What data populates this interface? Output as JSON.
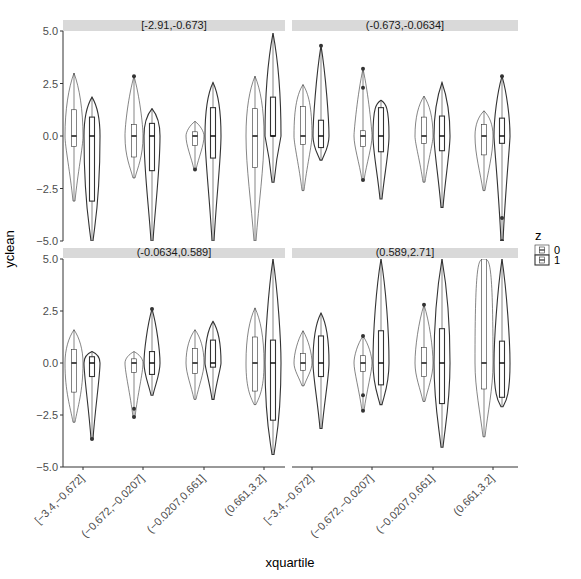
{
  "chart_data": {
    "type": "violin",
    "title": "",
    "xlabel": "xquartile",
    "ylabel": "yclean",
    "ylim": [
      -5.0,
      5.0
    ],
    "y_ticks": [
      "5.0",
      "2.5",
      "0.0",
      "-2.5",
      "-5.0"
    ],
    "grid": false,
    "facet_by": "xz quartile",
    "facet_layout": [
      2,
      2
    ],
    "legend": {
      "title": "z",
      "position": "right",
      "entries": [
        "0",
        "1"
      ]
    },
    "categories": [
      "[-3.4,-0.672]",
      "(-0.672,-0.0207]",
      "(-0.0207,0.661]",
      "(0.661,3.2]"
    ],
    "panels": [
      {
        "label": "[-2.91,-0.673]",
        "series": [
          {
            "name": "0",
            "groups": [
              {
                "min": -3.1,
                "q1": -0.5,
                "median": 0.0,
                "q3": 1.25,
                "max": 3.0,
                "outliers": []
              },
              {
                "min": -2.0,
                "q1": -1.0,
                "median": 0.0,
                "q3": 0.55,
                "max": 2.85,
                "outliers": [
                  2.85
                ]
              },
              {
                "min": -1.6,
                "q1": -0.45,
                "median": 0.0,
                "q3": 0.2,
                "max": 0.7,
                "outliers": [
                  -1.6
                ]
              },
              {
                "min": -5.0,
                "q1": -1.5,
                "median": 0.0,
                "q3": 1.3,
                "max": 2.85,
                "outliers": []
              }
            ]
          },
          {
            "name": "1",
            "groups": [
              {
                "min": -5.0,
                "q1": -3.1,
                "median": 0.0,
                "q3": 0.9,
                "max": 1.85,
                "outliers": []
              },
              {
                "min": -5.0,
                "q1": -1.65,
                "median": 0.0,
                "q3": 0.6,
                "max": 1.3,
                "outliers": []
              },
              {
                "min": -5.0,
                "q1": -1.05,
                "median": 0.0,
                "q3": 1.35,
                "max": 2.55,
                "outliers": []
              },
              {
                "min": -2.2,
                "q1": -0.0,
                "median": 0.0,
                "q3": 1.85,
                "max": 4.9,
                "outliers": []
              }
            ]
          }
        ]
      },
      {
        "label": "(-0.673,-0.0634]",
        "series": [
          {
            "name": "0",
            "groups": [
              {
                "min": -2.6,
                "q1": -0.4,
                "median": 0.0,
                "q3": 1.4,
                "max": 2.45,
                "outliers": []
              },
              {
                "min": -2.1,
                "q1": -0.5,
                "median": 0.0,
                "q3": 0.25,
                "max": 3.2,
                "outliers": [
                  3.2,
                  2.3,
                  -2.1
                ]
              },
              {
                "min": -2.2,
                "q1": -0.35,
                "median": 0.0,
                "q3": 0.9,
                "max": 1.9,
                "outliers": []
              },
              {
                "min": -2.6,
                "q1": -0.9,
                "median": 0.0,
                "q3": 0.55,
                "max": 1.2,
                "outliers": []
              }
            ]
          },
          {
            "name": "1",
            "groups": [
              {
                "min": -1.15,
                "q1": -0.55,
                "median": 0.0,
                "q3": 0.75,
                "max": 4.3,
                "outliers": [
                  4.3
                ]
              },
              {
                "min": -3.0,
                "q1": -0.75,
                "median": 0.0,
                "q3": 1.35,
                "max": 1.7,
                "outliers": []
              },
              {
                "min": -3.4,
                "q1": -0.7,
                "median": 0.0,
                "q3": 0.95,
                "max": 2.55,
                "outliers": []
              },
              {
                "min": -5.0,
                "q1": -0.35,
                "median": 0.0,
                "q3": 0.85,
                "max": 2.85,
                "outliers": [
                  2.85,
                  -3.9,
                  -5.0
                ]
              }
            ]
          }
        ]
      },
      {
        "label": "(-0.0634,0.589]",
        "series": [
          {
            "name": "0",
            "groups": [
              {
                "min": -2.85,
                "q1": -1.4,
                "median": 0.0,
                "q3": 0.65,
                "max": 1.6,
                "outliers": []
              },
              {
                "min": -2.6,
                "q1": -0.45,
                "median": 0.0,
                "q3": 0.2,
                "max": 0.55,
                "outliers": [
                  -2.2,
                  -2.6
                ]
              },
              {
                "min": -1.75,
                "q1": -0.5,
                "median": 0.0,
                "q3": 0.7,
                "max": 1.6,
                "outliers": []
              },
              {
                "min": -2.0,
                "q1": -1.35,
                "median": 0.0,
                "q3": 1.25,
                "max": 2.65,
                "outliers": []
              }
            ]
          },
          {
            "name": "1",
            "groups": [
              {
                "min": -3.65,
                "q1": -0.65,
                "median": 0.0,
                "q3": 0.3,
                "max": 0.55,
                "outliers": [
                  -3.65
                ]
              },
              {
                "min": -1.55,
                "q1": -0.55,
                "median": 0.0,
                "q3": 0.55,
                "max": 2.6,
                "outliers": [
                  2.6
                ]
              },
              {
                "min": -1.75,
                "q1": -0.2,
                "median": 0.0,
                "q3": 1.1,
                "max": 2.0,
                "outliers": []
              },
              {
                "min": -4.4,
                "q1": -2.75,
                "median": 0.0,
                "q3": 1.1,
                "max": 5.0,
                "outliers": []
              }
            ]
          }
        ]
      },
      {
        "label": "(0.589,2.71]",
        "series": [
          {
            "name": "0",
            "groups": [
              {
                "min": -1.1,
                "q1": -0.35,
                "median": 0.0,
                "q3": 0.45,
                "max": 1.55,
                "outliers": []
              },
              {
                "min": -2.3,
                "q1": -0.4,
                "median": 0.0,
                "q3": 0.35,
                "max": 1.3,
                "outliers": [
                  1.3,
                  -1.55,
                  -2.3
                ]
              },
              {
                "min": -1.85,
                "q1": -0.65,
                "median": 0.0,
                "q3": 0.75,
                "max": 2.8,
                "outliers": [
                  2.8
                ]
              },
              {
                "min": -3.55,
                "q1": -1.25,
                "median": 0.0,
                "q3": 5.0,
                "max": 5.0,
                "outliers": []
              }
            ]
          },
          {
            "name": "1",
            "groups": [
              {
                "min": -3.15,
                "q1": -0.65,
                "median": 0.0,
                "q3": 1.3,
                "max": 2.4,
                "outliers": []
              },
              {
                "min": -2.0,
                "q1": -1.05,
                "median": 0.0,
                "q3": 1.55,
                "max": 5.0,
                "outliers": []
              },
              {
                "min": -4.05,
                "q1": -1.95,
                "median": 0.0,
                "q3": 1.65,
                "max": 5.0,
                "outliers": []
              },
              {
                "min": -2.1,
                "q1": -1.65,
                "median": 0.0,
                "q3": 1.05,
                "max": 5.0,
                "outliers": []
              }
            ]
          }
        ]
      }
    ]
  },
  "colors": {
    "strip_bg": "#d9d9d9",
    "axis": "#333333",
    "violin_z0_fill": "#ffffff",
    "violin_z1_fill": "#ffffff",
    "outline": "#333333",
    "tick_text": "#4d4d4d"
  }
}
